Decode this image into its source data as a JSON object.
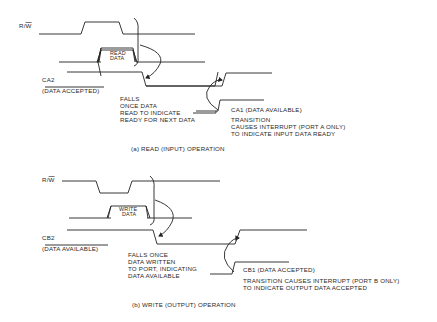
{
  "diagram_a": {
    "rw_label": "R/W",
    "rw_bar": "W",
    "rw_prefix": "R/",
    "data_box": [
      "READ",
      "DATA"
    ],
    "ca2_label": "CA2",
    "ca2_desc": "(DATA ACCEPTED)",
    "falls_note": [
      "FALLS",
      "ONCE DATA",
      "READ TO INDICATE",
      "READY FOR NEXT DATA"
    ],
    "ca1_label": "CA1 (DATA AVAILABLE)",
    "transition_note": [
      "TRANSITION",
      "CAUSES INTERRUPT (PORT A ONLY)",
      "TO INDICATE INPUT DATA READY"
    ],
    "caption": "(a) READ (INPUT) OPERATION"
  },
  "diagram_b": {
    "rw_prefix": "R/",
    "rw_bar": "W",
    "data_box": [
      "WRITE",
      "DATA"
    ],
    "cb2_label": "CB2",
    "cb2_desc": "(DATA AVAILABLE)",
    "falls_note": [
      "FALLS ONCE",
      "DATA WRITTEN",
      "TO PORT, INDICATING",
      "DATA AVAILABLE"
    ],
    "cb1_label": "CB1 (DATA ACCEPTED)",
    "transition_note": [
      "TRANSITION CAUSES INTERRUPT (PORT B ONLY)",
      "TO INDICATE OUTPUT DATA ACCEPTED"
    ],
    "caption": "(b) WRITE (OUTPUT) OPERATION"
  }
}
